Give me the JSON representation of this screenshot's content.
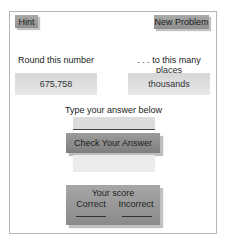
{
  "toolbar": {
    "hint_label": "Hint",
    "new_problem_label": "New Problem"
  },
  "problem": {
    "round_label": "Round this number",
    "places_label": ". . . to this many places",
    "number_value": "675,758",
    "places_value": "thousands"
  },
  "answer": {
    "prompt": "Type your answer below",
    "value": "",
    "check_label": "Check Your Answer",
    "feedback": ""
  },
  "score": {
    "title": "Your score",
    "correct_label": "Correct",
    "incorrect_label": "Incorrect",
    "correct_value": "",
    "incorrect_value": ""
  }
}
